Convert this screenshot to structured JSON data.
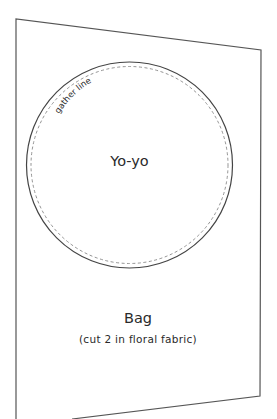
{
  "pattern": {
    "piece_name": "Bag",
    "instruction": "(cut 2 in floral fabric)",
    "outline_color": "#555555",
    "text_color": "#2a2a2a"
  },
  "yoyo": {
    "label": "Yo-yo",
    "gather_label": "gather line",
    "circle_color": "#444444",
    "gather_line_color": "#888888"
  }
}
